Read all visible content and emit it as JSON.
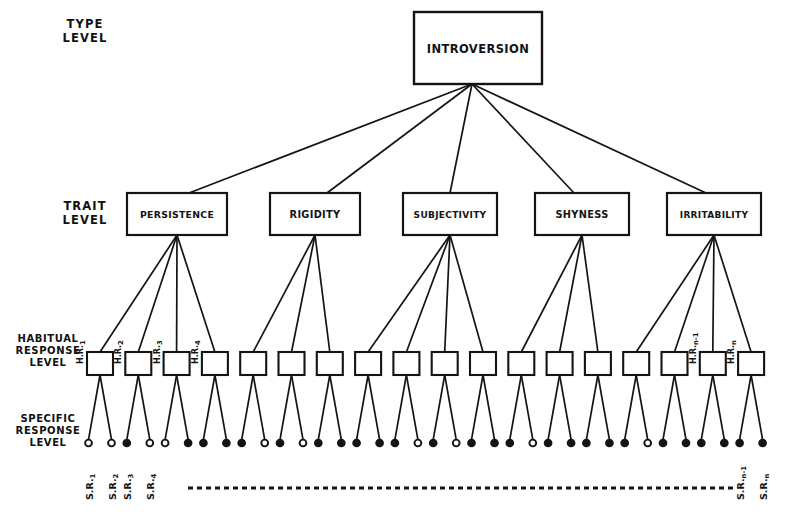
{
  "figure": {
    "background_color": "#ffffff",
    "ink_color": "#141414"
  },
  "levels": [
    {
      "id": "type",
      "label": "TYPE\nLEVEL"
    },
    {
      "id": "trait",
      "label": "TRAIT\nLEVEL"
    },
    {
      "id": "habitual",
      "label": "HABITUAL\nRESPONSE\nLEVEL"
    },
    {
      "id": "specific",
      "label": "SPECIFIC\nRESPONSE\nLEVEL"
    }
  ],
  "type_node": {
    "label": "INTROVERSION",
    "x": 414,
    "y": 12,
    "w": 128,
    "h": 72,
    "font_size": 11.5
  },
  "traits": [
    {
      "label": "PERSISTENCE",
      "x": 127,
      "y": 193,
      "w": 100,
      "h": 42,
      "font_size": 9.3,
      "children": 4
    },
    {
      "label": "RIGIDITY",
      "x": 270,
      "y": 193,
      "w": 90,
      "h": 42,
      "font_size": 9.8,
      "children": 3
    },
    {
      "label": "SUBJECTIVITY",
      "x": 403,
      "y": 193,
      "w": 94,
      "h": 42,
      "font_size": 9.0,
      "children": 4
    },
    {
      "label": "SHYNESS",
      "x": 535,
      "y": 193,
      "w": 94,
      "h": 42,
      "font_size": 9.8,
      "children": 3
    },
    {
      "label": "IRRITABILITY",
      "x": 667,
      "y": 193,
      "w": 94,
      "h": 42,
      "font_size": 9.0,
      "children": 4
    }
  ],
  "habitual_responses": {
    "count": 18,
    "box_w": 26,
    "box_h": 23,
    "row_y": 352,
    "first_x": 100,
    "spacing": 38.3,
    "labels": [
      {
        "index": 0,
        "text": "H.R.",
        "sub": "1"
      },
      {
        "index": 1,
        "text": "H.R.",
        "sub": "2"
      },
      {
        "index": 2,
        "text": "H.R.",
        "sub": "3"
      },
      {
        "index": 3,
        "text": "H.R.",
        "sub": "4"
      },
      {
        "index": 16,
        "text": "H.R.",
        "sub": "n-1"
      },
      {
        "index": 17,
        "text": "H.R.",
        "sub": "n"
      }
    ]
  },
  "specific_responses": {
    "per_habitual": 2,
    "dot_row_y": 443,
    "dot_radius": 3.4,
    "filled_pattern": "alternating-mixed"
  },
  "sr_axis": {
    "left_labels": [
      {
        "text": "S.R.",
        "sub": "1"
      },
      {
        "text": "S.R.",
        "sub": "2"
      },
      {
        "text": "S.R.",
        "sub": "3"
      },
      {
        "text": "S.R.",
        "sub": "4"
      }
    ],
    "right_labels": [
      {
        "text": "S.R.",
        "sub": "n-1"
      },
      {
        "text": "S.R.",
        "sub": "n"
      }
    ],
    "dashed_line": {
      "y": 488,
      "x_start": 188,
      "x_end": 733,
      "dash": "5 4"
    }
  }
}
